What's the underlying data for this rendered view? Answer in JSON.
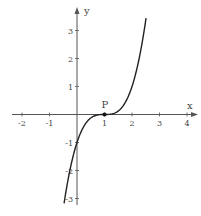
{
  "chart_data": {
    "type": "line",
    "title": "",
    "xlabel": "x",
    "ylabel": "y",
    "xlim": [
      -2.2,
      4.4
    ],
    "ylim": [
      -3.3,
      3.8
    ],
    "grid": false,
    "x_ticks": [
      -2,
      -1,
      1,
      2,
      3,
      4
    ],
    "y_ticks": [
      -3,
      -2,
      -1,
      1,
      2,
      3
    ],
    "x_tick_labels": [
      "-2",
      "-1",
      "1",
      "2",
      "3",
      "4"
    ],
    "y_tick_labels": [
      "-3",
      "-2",
      "-1",
      "1",
      "2",
      "3"
    ],
    "series": [
      {
        "name": "curve",
        "function": "y = (x - 1)^3",
        "x": [
          -0.47,
          -0.25,
          0,
          0.25,
          0.5,
          0.75,
          1,
          1.25,
          1.5,
          1.75,
          2,
          2.25,
          2.51
        ],
        "y": [
          -3.18,
          -1.95,
          -1,
          -0.42,
          -0.125,
          -0.016,
          0,
          0.016,
          0.125,
          0.42,
          1,
          1.95,
          3.44
        ],
        "color": "#222222"
      }
    ],
    "points": [
      {
        "label": "P",
        "x": 1,
        "y": 0
      }
    ],
    "annotations": [
      "P"
    ]
  },
  "colors": {
    "axis": "#555555",
    "curve": "#222222",
    "text": "#444444"
  }
}
